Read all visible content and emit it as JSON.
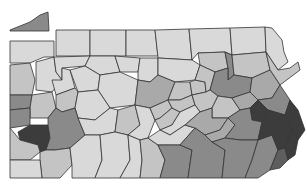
{
  "map": {
    "subject": "Pennsylvania counties choropleth",
    "background": "#ffffff",
    "border_color": "#333333",
    "shades": {
      "1": "#d9d9d9",
      "2": "#c4c4c4",
      "3": "#a9a9a9",
      "4": "#8a8a8a",
      "5": "#5e5e5e",
      "6": "#3c3c3c"
    },
    "counties": [
      {
        "name": "Erie",
        "shade": 4,
        "points": "10,30 30,22 40,15 48,12 49,31 10,31"
      },
      {
        "name": "Crawford",
        "shade": 1,
        "points": "10,41 10,63 30,63 44,57 54,57 54,41"
      },
      {
        "name": "Warren",
        "shade": 1,
        "points": "56,30 90,30 90,56 56,56"
      },
      {
        "name": "McKean",
        "shade": 1,
        "points": "90,30 126,30 126,56 90,56"
      },
      {
        "name": "Potter",
        "shade": 1,
        "points": "126,30 155,30 158,56 126,56"
      },
      {
        "name": "Tioga",
        "shade": 1,
        "points": "155,30 189,29 192,60 158,58"
      },
      {
        "name": "Bradford",
        "shade": 1,
        "points": "189,29 230,28 232,55 225,52 198,53 192,60"
      },
      {
        "name": "Susquehanna",
        "shade": 1,
        "points": "230,28 265,27 266,52 232,55"
      },
      {
        "name": "Wayne",
        "shade": 1,
        "points": "265,27 272,28 282,40 284,52 288,62 278,70 266,52"
      },
      {
        "name": "Mercer",
        "shade": 2,
        "points": "10,65 30,63 35,80 32,95 10,95"
      },
      {
        "name": "Venango",
        "shade": 1,
        "points": "36,62 54,57 56,72 62,80 52,92 36,90"
      },
      {
        "name": "Forest",
        "shade": 1,
        "points": "54,57 90,56 85,66 62,68 62,80 56,72"
      },
      {
        "name": "Elk",
        "shade": 1,
        "points": "90,56 115,56 120,72 100,75 85,66"
      },
      {
        "name": "Cameron",
        "shade": 1,
        "points": "115,56 140,58 138,72 120,72"
      },
      {
        "name": "Clinton",
        "shade": 1,
        "points": "140,58 158,58 158,75 150,82 138,80 138,72"
      },
      {
        "name": "Lycoming",
        "shade": 1,
        "points": "158,58 192,60 200,65 195,80 175,82 158,75"
      },
      {
        "name": "Sullivan",
        "shade": 2,
        "points": "198,53 225,52 228,68 215,72 200,65"
      },
      {
        "name": "Wyoming",
        "shade": 4,
        "points": "225,52 232,55 234,75 228,80 228,68"
      },
      {
        "name": "Lackawanna",
        "shade": 2,
        "points": "232,55 266,52 270,70 252,78 234,75"
      },
      {
        "name": "Pike",
        "shade": 2,
        "points": "266,52 278,70 290,68 298,62 300,70 280,85 270,70"
      },
      {
        "name": "Lawrence",
        "shade": 4,
        "points": "10,95 32,95 30,108 10,110"
      },
      {
        "name": "Butler",
        "shade": 2,
        "points": "32,95 52,92 56,108 48,118 30,118 30,108"
      },
      {
        "name": "Clarion",
        "shade": 1,
        "points": "52,80 62,80 62,68 70,70 75,88 56,95"
      },
      {
        "name": "Jefferson",
        "shade": 1,
        "points": "70,70 85,66 100,75 98,90 78,92"
      },
      {
        "name": "Clearfield",
        "shade": 1,
        "points": "100,75 120,72 138,80 135,105 110,108 98,90"
      },
      {
        "name": "Centre",
        "shade": 3,
        "points": "138,80 150,82 158,75 175,82 168,100 150,108 135,105"
      },
      {
        "name": "Union",
        "shade": 2,
        "points": "175,82 190,82 192,95 180,100 168,100"
      },
      {
        "name": "Montour",
        "shade": 2,
        "points": "195,80 205,82 206,92 192,95 190,82"
      },
      {
        "name": "Columbia",
        "shade": 2,
        "points": "200,65 215,72 210,90 206,92 205,82 195,80"
      },
      {
        "name": "Luzerne",
        "shade": 4,
        "points": "215,72 228,68 228,80 234,75 252,78 250,92 232,98 218,96 210,90"
      },
      {
        "name": "Monroe",
        "shade": 3,
        "points": "252,78 270,70 280,85 272,98 258,100 250,92"
      },
      {
        "name": "Beaver",
        "shade": 4,
        "points": "10,110 30,108 30,125 10,128"
      },
      {
        "name": "Allegheny",
        "shade": 6,
        "points": "18,132 30,125 48,125 50,138 46,150 40,152 38,145 20,140"
      },
      {
        "name": "Armstrong",
        "shade": 2,
        "points": "56,95 75,88 78,92 75,108 62,112 56,108"
      },
      {
        "name": "Indiana",
        "shade": 1,
        "points": "78,92 98,90 110,108 95,120 78,118 75,108"
      },
      {
        "name": "Westmoreland",
        "shade": 4,
        "points": "48,118 56,108 62,112 75,108 78,118 85,135 70,148 55,150 46,150 50,138 48,125"
      },
      {
        "name": "Cambria",
        "shade": 1,
        "points": "95,120 110,108 118,110 115,132 100,135 85,135 78,118"
      },
      {
        "name": "Blair",
        "shade": 2,
        "points": "118,110 135,105 140,125 128,135 115,132"
      },
      {
        "name": "Huntingdon",
        "shade": 1,
        "points": "135,105 150,108 155,120 148,138 140,140 128,135 140,125"
      },
      {
        "name": "Mifflin",
        "shade": 2,
        "points": "150,108 168,100 172,108 160,118 155,120"
      },
      {
        "name": "Juniata",
        "shade": 2,
        "points": "155,120 160,118 172,108 180,112 172,125 160,130"
      },
      {
        "name": "Snyder",
        "shade": 2,
        "points": "168,100 180,100 192,95 195,105 180,112 172,108"
      },
      {
        "name": "Northumberland",
        "shade": 2,
        "points": "192,95 206,92 210,90 218,96 212,108 200,112 195,105"
      },
      {
        "name": "Schuylkill",
        "shade": 2,
        "points": "218,96 232,98 240,110 228,118 212,118 212,108"
      },
      {
        "name": "Carbon",
        "shade": 3,
        "points": "232,98 250,92 258,100 250,108 240,110"
      },
      {
        "name": "Northampton",
        "shade": 4,
        "points": "258,100 272,98 280,85 290,100 285,115 268,110"
      },
      {
        "name": "Lehigh",
        "shade": 6,
        "points": "250,108 258,100 268,110 262,122 252,120"
      },
      {
        "name": "Washington",
        "shade": 2,
        "points": "10,128 20,140 38,145 40,152 30,160 10,160"
      },
      {
        "name": "Fayette",
        "shade": 2,
        "points": "46,150 55,150 70,148 72,165 60,178 42,178 40,160 40,152"
      },
      {
        "name": "Greene",
        "shade": 1,
        "points": "10,160 30,160 40,160 42,178 10,178"
      },
      {
        "name": "Somerset",
        "shade": 1,
        "points": "70,148 85,135 100,135 102,160 95,178 72,178 72,165"
      },
      {
        "name": "Bedford",
        "shade": 1,
        "points": "100,135 115,132 128,135 130,160 120,178 95,178 102,160"
      },
      {
        "name": "Fulton",
        "shade": 1,
        "points": "128,135 140,140 142,160 140,178 120,178 130,160"
      },
      {
        "name": "Franklin",
        "shade": 2,
        "points": "140,140 148,138 158,145 165,160 160,178 140,178 142,160"
      },
      {
        "name": "Perry",
        "shade": 1,
        "points": "160,130 172,125 180,112 195,105 200,112 185,125 170,135"
      },
      {
        "name": "Cumberland",
        "shade": 1,
        "points": "148,138 160,130 170,135 185,125 195,128 180,145 158,145"
      },
      {
        "name": "Dauphin",
        "shade": 3,
        "points": "200,112 212,108 212,118 228,118 220,130 205,135 195,128 185,125"
      },
      {
        "name": "Lebanon",
        "shade": 3,
        "points": "205,135 220,130 228,118 235,125 225,138 212,142"
      },
      {
        "name": "Berks",
        "shade": 4,
        "points": "228,118 240,110 250,108 252,120 262,122 258,140 240,140 225,138 235,125"
      },
      {
        "name": "Adams",
        "shade": 4,
        "points": "158,145 180,145 192,150 188,178 160,178 165,160"
      },
      {
        "name": "York",
        "shade": 4,
        "points": "180,145 195,128 205,135 212,142 225,150 222,178 188,178 192,150"
      },
      {
        "name": "Lancaster",
        "shade": 4,
        "points": "212,142 225,138 240,140 258,140 252,160 245,178 222,178 225,150"
      },
      {
        "name": "Chester",
        "shade": 4,
        "points": "258,140 272,135 278,150 270,170 258,178 245,178 252,160"
      },
      {
        "name": "Montgomery",
        "shade": 6,
        "points": "262,122 268,110 285,115 292,130 285,148 278,150 272,135 258,140"
      },
      {
        "name": "Bucks",
        "shade": 6,
        "points": "285,115 290,100 298,110 305,130 298,140 292,130"
      },
      {
        "name": "Delaware",
        "shade": 5,
        "points": "278,150 285,148 288,160 280,168 270,170"
      },
      {
        "name": "Philadelphia",
        "shade": 6,
        "points": "285,148 292,130 298,140 295,155 288,160"
      }
    ]
  }
}
